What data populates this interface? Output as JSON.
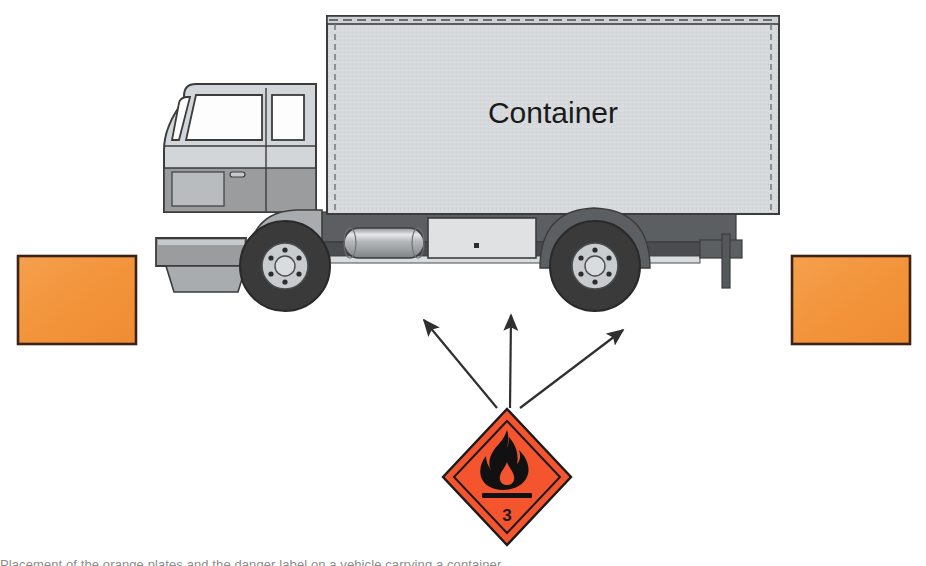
{
  "figure": {
    "background_color": "#ffffff",
    "width": 926,
    "height": 566
  },
  "truck": {
    "body_label": "Container",
    "body_fill": "#d5d8da",
    "body_stroke": "#3c3c3c",
    "cab_fill": "#d3d6d8",
    "cab_lower_fill": "#9a9c9e",
    "chassis_fill": "#575a5c",
    "chassis_dark": "#4a4d4f",
    "window_fill": "#fdfdfd",
    "tire_fill": "#3a3a3a",
    "hub_fill": "#c9ccce",
    "tank_fill": "#b9bcbe",
    "toolbox_fill": "#dfe1e3",
    "lug_count": 6,
    "parts": [
      "container-body",
      "cab",
      "windshield",
      "side-window",
      "door",
      "door-handle",
      "front-bumper",
      "air-dam",
      "front-wheel",
      "rear-wheel",
      "fuel-tank",
      "toolbox",
      "chassis-rail",
      "rear-underrun-bar"
    ]
  },
  "orange_plates": [
    {
      "name": "left-orange-plate",
      "fill": "#f3983f",
      "stroke": "#3a2418",
      "x": 18,
      "y": 256,
      "width": 118,
      "height": 88
    },
    {
      "name": "right-orange-plate",
      "fill": "#f3983f",
      "stroke": "#3a2418",
      "x": 792,
      "y": 256,
      "width": 118,
      "height": 88
    }
  ],
  "placard": {
    "name": "class-3-flammable-liquid-placard",
    "class_number": "3",
    "fill": "#f4552e",
    "stroke": "#1a1a1a",
    "symbol": "flame-icon",
    "center_x": 507,
    "center_y": 477,
    "half_width": 64,
    "half_height": 68
  },
  "arrows": {
    "color": "#2f2f2f",
    "origin_x": 507,
    "origin_y": 411,
    "items": [
      {
        "name": "arrow-to-left-plate",
        "tip_x": 422,
        "tip_y": 317
      },
      {
        "name": "arrow-to-top-center",
        "tip_x": 512,
        "tip_y": 312
      },
      {
        "name": "arrow-to-right-plate",
        "tip_x": 625,
        "tip_y": 327
      }
    ]
  },
  "caption": {
    "text": "Placement of the orange plates and the danger label on a vehicle carrying a container."
  }
}
